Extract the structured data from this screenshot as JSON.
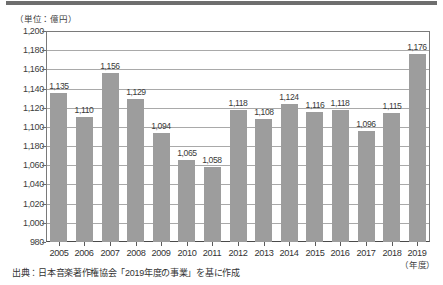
{
  "unit_label": "（単位：億円）",
  "xaxis_unit": "（年度）",
  "source_note": "出典：日本音楽著作権協会「2019年度の事業」を基に作成",
  "colors": {
    "bar": "#9d9d9d",
    "gridline": "#a9a9a9",
    "axis": "#4a4a4a",
    "text": "#333333",
    "top_rule": "#6e6e6e"
  },
  "yticks": [
    {
      "value": 1200,
      "label": "1,200"
    },
    {
      "value": 1180,
      "label": "1,180"
    },
    {
      "value": 1160,
      "label": "1,160"
    },
    {
      "value": 1140,
      "label": "1,140"
    },
    {
      "value": 1120,
      "label": "1,120"
    },
    {
      "value": 1100,
      "label": "1,100"
    },
    {
      "value": 1080,
      "label": "1,180"
    },
    {
      "value": 1060,
      "label": "1,060"
    },
    {
      "value": 1040,
      "label": "1,040"
    },
    {
      "value": 1020,
      "label": "1,020"
    },
    {
      "value": 1000,
      "label": "1,000"
    },
    {
      "value": 980,
      "label": "980"
    }
  ],
  "chart_data": {
    "type": "bar",
    "title": "",
    "subtitle": "",
    "xlabel": "（年度）",
    "ylabel": "（単位：億円）",
    "ylim": [
      980,
      1200
    ],
    "ytick_step": 20,
    "grid": true,
    "legend": "none",
    "categories": [
      "2005",
      "2006",
      "2007",
      "2008",
      "2009",
      "2010",
      "2011",
      "2012",
      "2013",
      "2014",
      "2015",
      "2016",
      "2017",
      "2018",
      "2019"
    ],
    "values": [
      1135,
      1110,
      1156,
      1129,
      1094,
      1065,
      1058,
      1118,
      1108,
      1124,
      1116,
      1118,
      1096,
      1115,
      1176
    ],
    "value_labels": [
      "1,135",
      "1,110",
      "1,156",
      "1,129",
      "1,094",
      "1,065",
      "1,058",
      "1,118",
      "1,108",
      "1,124",
      "1,116",
      "1,118",
      "1,096",
      "1,115",
      "1,176"
    ],
    "annotations": [
      "出典：日本音楽著作権協会「2019年度の事業」を基に作成"
    ]
  }
}
